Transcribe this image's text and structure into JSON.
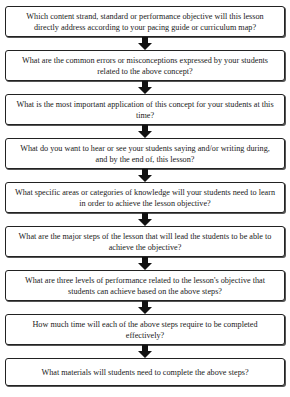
{
  "diagram": {
    "title_partial": "Lesson Planning Questions Sequence",
    "steps": [
      {
        "text": "Which content strand, standard or performance objective will this lesson directly address according to your pacing guide or curriculum map?"
      },
      {
        "text": "What are the common errors or misconceptions expressed by your students related to the above concept?"
      },
      {
        "text": "What is the most important application of this concept for your students at this time?"
      },
      {
        "text": "What do you want to hear or see your students saying and/or writing during, and by the end of, this lesson?"
      },
      {
        "text": "What specific areas or categories of knowledge will your students need to learn in order to achieve the lesson objective?"
      },
      {
        "text": "What are the major steps of the lesson that will lead the students to be able to achieve the objective?"
      },
      {
        "text": "What are three levels of performance related to the lesson's objective that students can achieve based on the above steps?"
      },
      {
        "text": "How much time will each of the above steps require to be completed effectively?"
      },
      {
        "text": "What materials will students need to complete the above steps?"
      }
    ],
    "connector_icon": "down-arrow-icon",
    "colors": {
      "border": "#222222",
      "arrow": "#111111",
      "background": "#ffffff"
    }
  }
}
